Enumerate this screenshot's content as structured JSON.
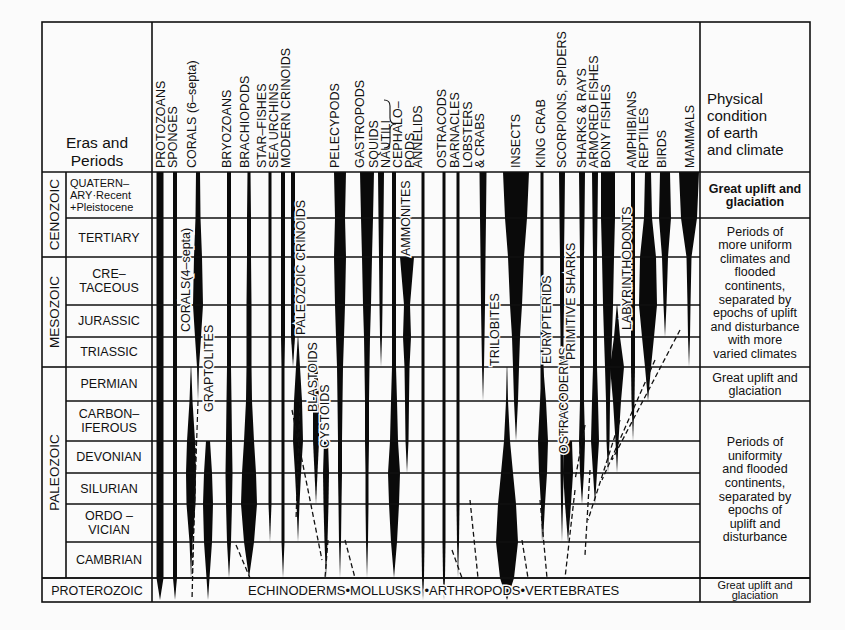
{
  "title_cell": {
    "line1": "Eras and",
    "line2": "Periods"
  },
  "condition_header": [
    "Physical",
    "condition",
    "of earth",
    "and climate"
  ],
  "groups_footer": "ECHINODERMS•MOLLUSKS      •ARTHROPODS•VERTEBRATES",
  "eras": [
    {
      "name": "CENOZOIC",
      "top": 172,
      "bottom": 257
    },
    {
      "name": "MESOZOIC",
      "top": 257,
      "bottom": 367
    },
    {
      "name": "PALEOZOIC",
      "top": 367,
      "bottom": 578
    },
    {
      "name": "PROTEROZOIC",
      "top": 578,
      "bottom": 602
    }
  ],
  "periods": [
    {
      "lines": [
        "QUATERN–",
        "ARY·Recent",
        "+Pleistocene"
      ],
      "top": 172,
      "bottom": 218,
      "small": true
    },
    {
      "lines": [
        "TERTIARY"
      ],
      "top": 218,
      "bottom": 257
    },
    {
      "lines": [
        "CRE–",
        "TACEOUS"
      ],
      "top": 257,
      "bottom": 305
    },
    {
      "lines": [
        "JURASSIC"
      ],
      "top": 305,
      "bottom": 337
    },
    {
      "lines": [
        "TRIASSIC"
      ],
      "top": 337,
      "bottom": 367
    },
    {
      "lines": [
        "PERMIAN"
      ],
      "top": 367,
      "bottom": 401
    },
    {
      "lines": [
        "CARBON–",
        "IFEROUS"
      ],
      "top": 401,
      "bottom": 441
    },
    {
      "lines": [
        "DEVONIAN"
      ],
      "top": 441,
      "bottom": 473
    },
    {
      "lines": [
        "SILURIAN"
      ],
      "top": 473,
      "bottom": 504
    },
    {
      "lines": [
        "ORDO –",
        "VICIAN"
      ],
      "top": 504,
      "bottom": 542
    },
    {
      "lines": [
        "CAMBRIAN"
      ],
      "top": 542,
      "bottom": 578
    }
  ],
  "climate": [
    {
      "lines": [
        "Great uplift and",
        "glaciation"
      ],
      "top": 172,
      "bottom": 218,
      "bold": true
    },
    {
      "lines": [
        "Periods of",
        "more uniform",
        "climates and",
        "flooded",
        "continents,",
        "separated by",
        "epochs of uplift",
        "and disturbance",
        "with more",
        "varied climates"
      ],
      "top": 218,
      "bottom": 367
    },
    {
      "lines": [
        "Great uplift and",
        "glaciation"
      ],
      "top": 367,
      "bottom": 401
    },
    {
      "lines": [
        "Periods of",
        "uniformity",
        "and flooded",
        "continents,",
        "separated by",
        "epochs of",
        "uplift and",
        "disturbance"
      ],
      "top": 401,
      "bottom": 578
    },
    {
      "lines": [
        "Great uplift and",
        "glaciation"
      ],
      "top": 578,
      "bottom": 602,
      "small": true
    }
  ],
  "column_headers": [
    {
      "x": 165,
      "text": "PROTOZOANS"
    },
    {
      "x": 177,
      "text": "SPONGES"
    },
    {
      "x": 196,
      "text": "CORALS (6–septa)"
    },
    {
      "x": 231,
      "text": "BRYOZOANS"
    },
    {
      "x": 249,
      "text": "BRACHIOPODS"
    },
    {
      "x": 266,
      "text": "STAR–FISHES"
    },
    {
      "x": 278,
      "text": "SEA URCHINS"
    },
    {
      "x": 290,
      "text": "MODERN  CRINOIDS"
    },
    {
      "x": 339,
      "text": "PELECYPODS"
    },
    {
      "x": 364,
      "text": "GASTROPODS"
    },
    {
      "x": 378,
      "text": "SQUIDS"
    },
    {
      "x": 390,
      "text": "NAUTILI"
    },
    {
      "x": 402,
      "text": "CEPHALO–"
    },
    {
      "x": 414,
      "text": "PODS"
    },
    {
      "x": 422,
      "text": "ANNELIDS"
    },
    {
      "x": 446,
      "text": "OSTRACODS"
    },
    {
      "x": 459,
      "text": "BARNACLES"
    },
    {
      "x": 472,
      "text": "LOBSTERS"
    },
    {
      "x": 484,
      "text": "& CRABS"
    },
    {
      "x": 520,
      "text": "INSECTS"
    },
    {
      "x": 545,
      "text": "KING CRAB"
    },
    {
      "x": 566,
      "text": "SCORPIONS,  SPIDERS"
    },
    {
      "x": 586,
      "text": "SHARKS  &  RAYS"
    },
    {
      "x": 598,
      "text": "ARMORED  FISHES"
    },
    {
      "x": 610,
      "text": "BONY  FISHES"
    },
    {
      "x": 636,
      "text": "AMPHIBIANS"
    },
    {
      "x": 648,
      "text": "REPTILES"
    },
    {
      "x": 666,
      "text": "BIRDS"
    },
    {
      "x": 694,
      "text": "MAMMALS"
    }
  ],
  "inner_labels": [
    {
      "x": 190,
      "y": 332,
      "text": "CORALS(4–septa)"
    },
    {
      "x": 213,
      "y": 412,
      "text": "GRAPTOLITES"
    },
    {
      "x": 305,
      "y": 335,
      "text": "PALEOZOIC  CRINOIDS"
    },
    {
      "x": 317,
      "y": 412,
      "text": "BLASTOIDS"
    },
    {
      "x": 329,
      "y": 448,
      "text": "CYSTOIDS"
    },
    {
      "x": 410,
      "y": 256,
      "text": "AMMONITES"
    },
    {
      "x": 499,
      "y": 366,
      "text": "TRILOBITES"
    },
    {
      "x": 551,
      "y": 364,
      "text": "EURYPTERIDS"
    },
    {
      "x": 568,
      "y": 454,
      "text": "OSTRACODERMS"
    },
    {
      "x": 575,
      "y": 360,
      "text": "PRIMITIVE  SHARKS"
    },
    {
      "x": 631,
      "y": 330,
      "text": "LABYRINTHODONTS"
    }
  ],
  "lineages": [
    {
      "name": "protozoans",
      "x": 160,
      "w": [
        7,
        7,
        7,
        7,
        7,
        7,
        7,
        7,
        7,
        7,
        7,
        7
      ],
      "from": 0,
      "to": 11
    },
    {
      "name": "sponges",
      "x": 175,
      "w": [
        4,
        4,
        4,
        4,
        4,
        4,
        4,
        4,
        4,
        4,
        4,
        4
      ],
      "from": 0,
      "to": 11
    },
    {
      "name": "corals-6-septa",
      "x": 198,
      "w": [
        4,
        5,
        8,
        10,
        6,
        2,
        0,
        0,
        0,
        0,
        0,
        0
      ],
      "from": 0,
      "to": 5,
      "dashTo": 11
    },
    {
      "name": "corals-4-septa",
      "x": 191,
      "w": [
        0,
        0,
        0,
        0,
        0,
        0,
        3,
        8,
        10,
        9,
        3,
        0
      ],
      "from": 5,
      "to": 10
    },
    {
      "name": "graptolites",
      "x": 208,
      "w": [
        0,
        0,
        0,
        0,
        0,
        0,
        0,
        4,
        8,
        10,
        8,
        3
      ],
      "from": 7,
      "to": 11
    },
    {
      "name": "bryozoans",
      "x": 229,
      "w": [
        4,
        4,
        4,
        4,
        4,
        4,
        5,
        6,
        7,
        6,
        4,
        2
      ],
      "from": 0,
      "to": 10
    },
    {
      "name": "brachiopods",
      "x": 249,
      "w": [
        3,
        4,
        4,
        5,
        5,
        5,
        6,
        10,
        14,
        16,
        10,
        3
      ],
      "from": 0,
      "to": 10
    },
    {
      "name": "star-fishes",
      "x": 270,
      "w": [
        3,
        3,
        3,
        3,
        3,
        3,
        3,
        3,
        3,
        3,
        2,
        0
      ],
      "from": 0,
      "to": 9
    },
    {
      "name": "sea-urchins",
      "x": 283,
      "w": [
        4,
        4,
        4,
        4,
        4,
        3,
        3,
        3,
        3,
        3,
        3,
        0
      ],
      "from": 0,
      "to": 10
    },
    {
      "name": "modern-crinoids",
      "x": 293,
      "w": [
        4,
        4,
        4,
        4,
        4,
        0,
        0,
        0,
        0,
        0,
        0,
        0
      ],
      "from": 0,
      "to": 4
    },
    {
      "name": "paleozoic-crinoids",
      "x": 298,
      "w": [
        0,
        0,
        0,
        0,
        0,
        4,
        8,
        10,
        6,
        3,
        0,
        0
      ],
      "from": 4,
      "to": 9
    },
    {
      "name": "blastoids",
      "x": 316,
      "w": [
        0,
        0,
        0,
        0,
        0,
        3,
        6,
        6,
        3,
        0,
        0,
        0
      ],
      "from": 5,
      "to": 8
    },
    {
      "name": "cystoids",
      "x": 326,
      "w": [
        0,
        0,
        0,
        0,
        0,
        0,
        0,
        4,
        6,
        5,
        3,
        0
      ],
      "from": 7,
      "to": 10
    },
    {
      "name": "pelecypods",
      "x": 340,
      "w": [
        12,
        10,
        12,
        10,
        8,
        6,
        5,
        4,
        4,
        3,
        2,
        0
      ],
      "from": 0,
      "to": 10
    },
    {
      "name": "gastropods",
      "x": 367,
      "w": [
        14,
        12,
        10,
        8,
        6,
        5,
        4,
        4,
        3,
        3,
        2,
        0
      ],
      "from": 0,
      "to": 10
    },
    {
      "name": "squids",
      "x": 381,
      "w": [
        6,
        5,
        4,
        3,
        2,
        0,
        0,
        0,
        0,
        0,
        0,
        0
      ],
      "from": 0,
      "to": 4
    },
    {
      "name": "nautili",
      "x": 394,
      "w": [
        4,
        4,
        4,
        4,
        4,
        4,
        6,
        8,
        12,
        10,
        6,
        0
      ],
      "from": 0,
      "to": 10
    },
    {
      "name": "ammonites",
      "x": 407,
      "w": [
        0,
        0,
        14,
        6,
        8,
        5,
        4,
        3,
        0,
        0,
        0,
        0
      ],
      "from": 2,
      "to": 7
    },
    {
      "name": "annelids",
      "x": 423,
      "w": [
        3,
        3,
        3,
        3,
        3,
        3,
        3,
        3,
        3,
        3,
        3,
        2
      ],
      "from": 0,
      "to": 11
    },
    {
      "name": "ostracods",
      "x": 444,
      "w": [
        3,
        3,
        3,
        3,
        3,
        3,
        3,
        3,
        3,
        3,
        3,
        2
      ],
      "from": 0,
      "to": 11
    },
    {
      "name": "barnacles",
      "x": 458,
      "w": [
        3,
        3,
        3,
        3,
        3,
        3,
        3,
        3,
        3,
        3,
        2,
        0
      ],
      "from": 0,
      "to": 10
    },
    {
      "name": "lobsters-crabs",
      "x": 483,
      "w": [
        7,
        6,
        5,
        4,
        3,
        2,
        0,
        0,
        0,
        0,
        0,
        0
      ],
      "from": 0,
      "to": 5
    },
    {
      "name": "trilobites",
      "x": 507,
      "w": [
        0,
        0,
        0,
        0,
        0,
        0,
        2,
        6,
        12,
        18,
        22,
        14
      ],
      "from": 5,
      "to": 11
    },
    {
      "name": "insects",
      "x": 516,
      "w": [
        26,
        22,
        16,
        12,
        8,
        6,
        4,
        0,
        0,
        0,
        0,
        0
      ],
      "from": 0,
      "to": 6
    },
    {
      "name": "king-crab",
      "x": 542,
      "w": [
        3,
        3,
        3,
        3,
        3,
        3,
        3,
        3,
        3,
        2,
        0,
        0
      ],
      "from": 0,
      "to": 9
    },
    {
      "name": "eurypterids",
      "x": 543,
      "w": [
        0,
        0,
        0,
        0,
        0,
        0,
        6,
        10,
        8,
        4,
        0,
        0
      ],
      "from": 5,
      "to": 9
    },
    {
      "name": "scorpions-spiders",
      "x": 562,
      "w": [
        6,
        5,
        4,
        4,
        3,
        3,
        3,
        3,
        3,
        2,
        0,
        0
      ],
      "from": 0,
      "to": 9
    },
    {
      "name": "ostracoderms",
      "x": 568,
      "w": [
        0,
        0,
        0,
        0,
        0,
        0,
        0,
        8,
        10,
        6,
        0,
        0
      ],
      "from": 7,
      "to": 9
    },
    {
      "name": "sharks-rays",
      "x": 582,
      "w": [
        6,
        5,
        4,
        4,
        4,
        4,
        4,
        6,
        4,
        0,
        0,
        0
      ],
      "from": 0,
      "to": 8
    },
    {
      "name": "armored-fishes",
      "x": 595,
      "w": [
        6,
        5,
        4,
        4,
        4,
        4,
        6,
        8,
        4,
        0,
        0,
        0
      ],
      "from": 0,
      "to": 8
    },
    {
      "name": "bony-fishes",
      "x": 608,
      "w": [
        14,
        14,
        12,
        10,
        8,
        6,
        4,
        3,
        0,
        0,
        0,
        0
      ],
      "from": 0,
      "to": 7
    },
    {
      "name": "labyrinthodonts",
      "x": 617,
      "w": [
        0,
        0,
        0,
        0,
        6,
        14,
        8,
        3,
        0,
        0,
        0,
        0
      ],
      "from": 3,
      "to": 7
    },
    {
      "name": "amphibians",
      "x": 633,
      "w": [
        4,
        4,
        4,
        4,
        4,
        4,
        3,
        0,
        0,
        0,
        0,
        0
      ],
      "from": 0,
      "to": 6
    },
    {
      "name": "reptiles",
      "x": 648,
      "w": [
        6,
        8,
        16,
        18,
        12,
        6,
        0,
        0,
        0,
        0,
        0,
        0
      ],
      "from": 0,
      "to": 5
    },
    {
      "name": "birds",
      "x": 665,
      "w": [
        10,
        12,
        6,
        3,
        0,
        0,
        0,
        0,
        0,
        0,
        0,
        0
      ],
      "from": 0,
      "to": 3
    },
    {
      "name": "mammals",
      "x": 689,
      "w": [
        20,
        16,
        5,
        3,
        2,
        0,
        0,
        0,
        0,
        0,
        0,
        0
      ],
      "from": 0,
      "to": 4
    }
  ],
  "dashed_links": [
    [
      196,
      440,
      192,
      600
    ],
    [
      236,
      545,
      250,
      578
    ],
    [
      292,
      410,
      322,
      560
    ],
    [
      300,
      400,
      296,
      520
    ],
    [
      328,
      540,
      325,
      578
    ],
    [
      345,
      540,
      355,
      578
    ],
    [
      452,
      550,
      462,
      578
    ],
    [
      470,
      500,
      478,
      578
    ],
    [
      522,
      540,
      528,
      578
    ],
    [
      540,
      500,
      547,
      578
    ],
    [
      575,
      490,
      565,
      578
    ],
    [
      590,
      470,
      585,
      555
    ],
    [
      620,
      420,
      588,
      520
    ],
    [
      655,
      360,
      602,
      480
    ],
    [
      680,
      330,
      612,
      460
    ],
    [
      585,
      425,
      575,
      480
    ]
  ]
}
